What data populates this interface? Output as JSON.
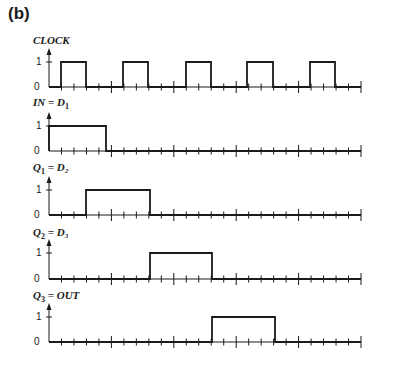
{
  "panel_label": "(b)",
  "axis": {
    "x_start": 49,
    "x_end": 361,
    "tick_count": 25,
    "major_every": 5,
    "level_high_label": "1",
    "level_low_label": "0"
  },
  "signals": [
    {
      "id": "clock",
      "label_main": "CLOCK",
      "label_sub": "",
      "label_rest": "",
      "label_y": 42,
      "high_y": 62,
      "base_y": 87,
      "pulses": [
        [
          61,
          86
        ],
        [
          123,
          148
        ],
        [
          186,
          211
        ],
        [
          247,
          273
        ],
        [
          310,
          335
        ]
      ]
    },
    {
      "id": "in-d1",
      "label_main": "IN = D",
      "label_sub": "1",
      "label_rest": "",
      "label_y": 104,
      "high_y": 126,
      "base_y": 151,
      "pulses": [
        [
          49,
          106
        ]
      ]
    },
    {
      "id": "q1-d2",
      "label_main": "Q",
      "label_sub": "1",
      "label_rest": " = D₂",
      "label_y": 169,
      "high_y": 190,
      "base_y": 215,
      "pulses": [
        [
          86,
          150
        ]
      ]
    },
    {
      "id": "q2-d3",
      "label_main": "Q",
      "label_sub": "2",
      "label_rest": " = D₃",
      "label_y": 234,
      "high_y": 253,
      "base_y": 279,
      "pulses": [
        [
          150,
          212
        ]
      ]
    },
    {
      "id": "q3-out",
      "label_main": "Q",
      "label_sub": "3",
      "label_rest": " = OUT",
      "label_y": 297,
      "high_y": 317,
      "base_y": 342,
      "pulses": [
        [
          212,
          275
        ]
      ]
    }
  ],
  "colors": {
    "line": "#1a1a1a",
    "background": "#ffffff"
  }
}
